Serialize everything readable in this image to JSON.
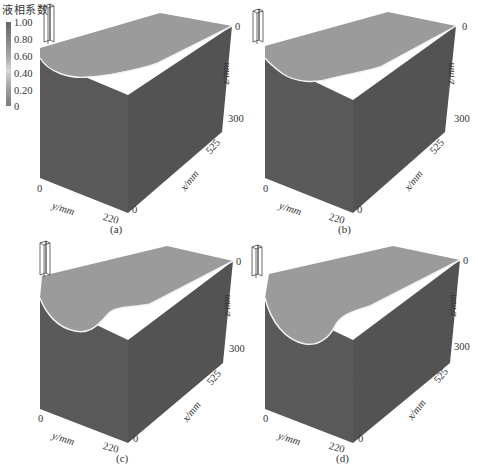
{
  "legend": {
    "title": "液相系数",
    "ticks": [
      "1.00",
      "0.80",
      "0.60",
      "0.40",
      "0.20",
      "0"
    ],
    "gradient": [
      "#666666",
      "#8a8a8a",
      "#b0b0b0",
      "#d8d8d8",
      "#a8a8a8",
      "#7a7a7a"
    ]
  },
  "axes": {
    "z_label": "z/mm",
    "z_min": "0",
    "z_max": "300",
    "x_label": "x/mm",
    "x_min": "0",
    "x_max": "525",
    "y_label": "y/mm",
    "y_min": "0",
    "y_max": "220"
  },
  "colors": {
    "top_face": "#9c9c9c",
    "left_face": "#5a5a5a",
    "right_face": "#545454",
    "interface_line": "#f2f2f2",
    "nozzle_stroke": "#444444"
  },
  "panels": [
    {
      "id": "a",
      "label": "(a)",
      "pool_depth": "shallow"
    },
    {
      "id": "b",
      "label": "(b)",
      "pool_depth": "medium"
    },
    {
      "id": "c",
      "label": "(c)",
      "pool_depth": "deep"
    },
    {
      "id": "d",
      "label": "(d)",
      "pool_depth": "deepest"
    }
  ],
  "caption": ""
}
